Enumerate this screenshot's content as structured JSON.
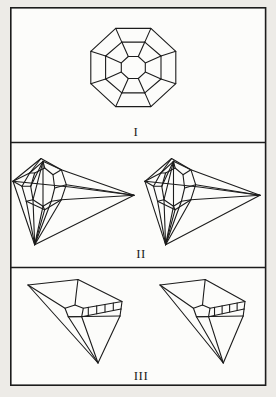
{
  "colors": {
    "page_background": "#edebe7",
    "paper": "#fcfcfa",
    "line": "#1c1c1c"
  },
  "plate": {
    "panels": [
      {
        "label": "I"
      },
      {
        "label": "II"
      },
      {
        "label": "III"
      }
    ]
  },
  "figures": {
    "panel1": {
      "description": "octagonal-cut-stone-plan-view",
      "polylines": [
        [
          [
            175.8,
            51.3
          ],
          [
            150.9,
            28.4
          ],
          [
            115.7,
            28.4
          ],
          [
            90.8,
            51.3
          ],
          [
            90.8,
            83.7
          ],
          [
            115.7,
            106.6
          ],
          [
            150.9,
            106.6
          ],
          [
            175.8,
            83.7
          ],
          [
            175.8,
            51.3
          ]
        ],
        [
          [
            161.0,
            56.0
          ],
          [
            144.8,
            42.1
          ],
          [
            121.8,
            42.1
          ],
          [
            105.6,
            56.0
          ],
          [
            105.6,
            79.0
          ],
          [
            121.8,
            92.9
          ],
          [
            144.8,
            92.9
          ],
          [
            161.0,
            79.0
          ],
          [
            161.0,
            56.0
          ]
        ],
        [
          [
            145.3,
            62.9
          ],
          [
            138.3,
            56.5
          ],
          [
            128.3,
            56.5
          ],
          [
            121.3,
            62.9
          ],
          [
            121.3,
            72.1
          ],
          [
            128.3,
            78.5
          ],
          [
            138.3,
            78.5
          ],
          [
            145.3,
            72.1
          ],
          [
            145.3,
            62.9
          ]
        ],
        [
          [
            175.8,
            51.3
          ],
          [
            161.0,
            56.0
          ]
        ],
        [
          [
            150.9,
            28.4
          ],
          [
            144.8,
            42.1
          ]
        ],
        [
          [
            115.7,
            28.4
          ],
          [
            121.8,
            42.1
          ]
        ],
        [
          [
            90.8,
            51.3
          ],
          [
            105.6,
            56.0
          ]
        ],
        [
          [
            90.8,
            83.7
          ],
          [
            105.6,
            79.0
          ]
        ],
        [
          [
            115.7,
            106.6
          ],
          [
            121.8,
            92.9
          ]
        ],
        [
          [
            150.9,
            106.6
          ],
          [
            144.8,
            92.9
          ]
        ],
        [
          [
            175.8,
            83.7
          ],
          [
            161.0,
            79.0
          ]
        ],
        [
          [
            161.0,
            56.0
          ],
          [
            145.3,
            62.9
          ]
        ],
        [
          [
            144.8,
            42.1
          ],
          [
            138.3,
            56.5
          ]
        ],
        [
          [
            121.8,
            42.1
          ],
          [
            128.3,
            56.5
          ]
        ],
        [
          [
            105.6,
            56.0
          ],
          [
            121.3,
            62.9
          ]
        ],
        [
          [
            105.6,
            79.0
          ],
          [
            121.3,
            72.1
          ]
        ],
        [
          [
            121.8,
            92.9
          ],
          [
            128.3,
            78.5
          ]
        ],
        [
          [
            144.8,
            92.9
          ],
          [
            138.3,
            78.5
          ]
        ],
        [
          [
            161.0,
            79.0
          ],
          [
            145.3,
            72.1
          ]
        ]
      ]
    },
    "panel2": {
      "description": "stereo-pair-cut-stone-perspective",
      "right_transform": {
        "translate_x": 132.6,
        "scale_x": 0.951
      },
      "polylines": [
        [
          [
            13,
            181.3
          ],
          [
            41,
            158.5
          ],
          [
            61.3,
            169.7
          ],
          [
            134,
            195.3
          ]
        ],
        [
          [
            134,
            195.3
          ],
          [
            34.7,
            244.7
          ],
          [
            13,
            181.3
          ]
        ],
        [
          [
            13,
            181.3
          ],
          [
            70,
            187
          ],
          [
            134,
            195.3
          ]
        ],
        [
          [
            43,
            161.3
          ],
          [
            61.3,
            169.7
          ],
          [
            66.3,
            184.7
          ],
          [
            61.3,
            199.7
          ],
          [
            44.7,
            209.7
          ],
          [
            26.3,
            201.3
          ],
          [
            22,
            186.3
          ],
          [
            29.7,
            173
          ],
          [
            43,
            161.3
          ]
        ],
        [
          [
            44.7,
            168
          ],
          [
            53,
            174.7
          ],
          [
            54.7,
            188
          ],
          [
            51.3,
            201.3
          ],
          [
            43,
            206.3
          ],
          [
            33,
            199.7
          ],
          [
            30.7,
            186.3
          ],
          [
            34.7,
            173
          ],
          [
            44.7,
            168
          ]
        ],
        [
          [
            43,
            161.3
          ],
          [
            44.7,
            168
          ]
        ],
        [
          [
            61.3,
            169.7
          ],
          [
            53,
            174.7
          ]
        ],
        [
          [
            66.3,
            184.7
          ],
          [
            54.7,
            188
          ]
        ],
        [
          [
            61.3,
            199.7
          ],
          [
            51.3,
            201.3
          ]
        ],
        [
          [
            44.7,
            209.7
          ],
          [
            43,
            206.3
          ]
        ],
        [
          [
            26.3,
            201.3
          ],
          [
            33,
            199.7
          ]
        ],
        [
          [
            22,
            186.3
          ],
          [
            30.7,
            186.3
          ]
        ],
        [
          [
            29.7,
            173
          ],
          [
            34.7,
            173
          ]
        ],
        [
          [
            34.7,
            244.7
          ],
          [
            26.3,
            201.3
          ]
        ],
        [
          [
            34.7,
            244.7
          ],
          [
            33,
            199.7
          ]
        ],
        [
          [
            34.7,
            244.7
          ],
          [
            43,
            206.3
          ]
        ],
        [
          [
            34.7,
            244.7
          ],
          [
            44.7,
            209.7
          ]
        ],
        [
          [
            34.7,
            244.7
          ],
          [
            51.3,
            201.3
          ]
        ],
        [
          [
            34.7,
            244.7
          ],
          [
            61.3,
            199.7
          ]
        ],
        [
          [
            43,
            161.3
          ],
          [
            33,
            199.7
          ]
        ],
        [
          [
            43,
            161.3
          ],
          [
            43,
            206.3
          ]
        ],
        [
          [
            43,
            161.3
          ],
          [
            30.7,
            186.3
          ]
        ],
        [
          [
            41,
            158.5
          ],
          [
            29.7,
            173
          ]
        ],
        [
          [
            13,
            181.3
          ],
          [
            22,
            186.3
          ]
        ],
        [
          [
            13,
            181.3
          ],
          [
            29.7,
            173
          ]
        ],
        [
          [
            134,
            195.3
          ],
          [
            66.3,
            184.7
          ]
        ],
        [
          [
            134,
            195.3
          ],
          [
            61.3,
            199.7
          ]
        ]
      ]
    },
    "panel3": {
      "description": "stereo-pair-cut-stone-oblique-view",
      "right_transform": {
        "translate_x": 134.7,
        "scale_x": 0.904
      },
      "polylines": [
        [
          [
            28,
            285
          ],
          [
            78,
            279.5
          ],
          [
            122,
            301.5
          ],
          [
            121,
            309
          ]
        ],
        [
          [
            121,
            309
          ],
          [
            120,
            316
          ]
        ],
        [
          [
            120,
            316
          ],
          [
            98,
            363
          ],
          [
            28,
            285
          ]
        ],
        [
          [
            65,
            308.3
          ],
          [
            75,
            305
          ],
          [
            83.3,
            308.3
          ],
          [
            81.7,
            316.7
          ],
          [
            68.3,
            316.7
          ],
          [
            65,
            308.3
          ]
        ],
        [
          [
            78,
            279.5
          ],
          [
            76.2,
            294
          ],
          [
            75,
            305
          ]
        ],
        [
          [
            28,
            285
          ],
          [
            65,
            308.3
          ]
        ],
        [
          [
            83.3,
            308.3
          ],
          [
            122,
            301.5
          ]
        ],
        [
          [
            81.7,
            316.7
          ],
          [
            121,
            309
          ]
        ],
        [
          [
            68.3,
            316.7
          ],
          [
            120,
            316
          ]
        ],
        [
          [
            88.3,
            307.4
          ],
          [
            88.3,
            315.4
          ]
        ],
        [
          [
            96.7,
            305.9
          ],
          [
            96.7,
            313.8
          ]
        ],
        [
          [
            105,
            304.5
          ],
          [
            105,
            312.1
          ]
        ],
        [
          [
            113.3,
            303
          ],
          [
            113.3,
            310.5
          ]
        ],
        [
          [
            98,
            363
          ],
          [
            68.3,
            316.7
          ]
        ],
        [
          [
            98,
            363
          ],
          [
            81.7,
            316.7
          ]
        ]
      ]
    }
  }
}
